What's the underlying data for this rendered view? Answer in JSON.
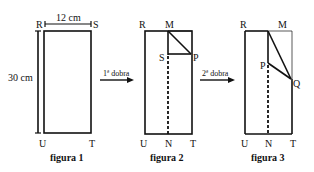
{
  "figures": [
    {
      "caption": "figura 1",
      "labels": {
        "R": "R",
        "S": "S",
        "U": "U",
        "T": "T"
      },
      "width_label": "12 cm",
      "height_label": "30 cm"
    },
    {
      "caption": "figura 2",
      "labels": {
        "R": "R",
        "M": "M",
        "S": "S",
        "P": "P",
        "U": "U",
        "N": "N",
        "T": "T"
      }
    },
    {
      "caption": "figura 3",
      "labels": {
        "R": "R",
        "M": "M",
        "P": "P",
        "Q": "Q",
        "U": "U",
        "N": "N",
        "T": "T"
      }
    }
  ],
  "arrows": [
    {
      "label": "1ª dobra"
    },
    {
      "label": "2ª dobra"
    }
  ],
  "colors": {
    "line": "#111111",
    "background": "#ffffff"
  }
}
